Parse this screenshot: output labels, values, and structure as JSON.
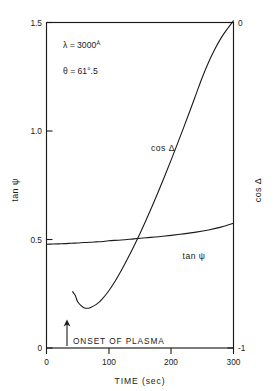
{
  "chart_data": {
    "type": "line",
    "title": "",
    "xlabel": "TIME (sec)",
    "ylabel": "tan ψ",
    "y2label": "cos Δ",
    "xlim": [
      0,
      300
    ],
    "ylim": [
      0,
      1.5
    ],
    "y2lim": [
      -1,
      0
    ],
    "xticks": [
      "0",
      "100",
      "200",
      "300"
    ],
    "xtick_values": [
      0,
      100,
      200,
      300
    ],
    "yticks": [
      "0",
      "0.5",
      "1.0",
      "1.5"
    ],
    "ytick_values": [
      0,
      0.5,
      1.0,
      1.5
    ],
    "y2ticks": [
      "-1",
      "0"
    ],
    "y2tick_values": [
      -1,
      0
    ],
    "grid": false,
    "legend_position": "inline-labels",
    "series": [
      {
        "name": "tan ψ",
        "axis": "left",
        "label_text": "tan ψ",
        "x": [
          0,
          10,
          20,
          30,
          40,
          50,
          60,
          70,
          80,
          90,
          100,
          120,
          140,
          160,
          180,
          200,
          220,
          240,
          260,
          280,
          300
        ],
        "values": [
          0.478,
          0.479,
          0.48,
          0.481,
          0.483,
          0.484,
          0.486,
          0.487,
          0.489,
          0.491,
          0.494,
          0.498,
          0.503,
          0.508,
          0.513,
          0.519,
          0.526,
          0.534,
          0.544,
          0.557,
          0.575
        ]
      },
      {
        "name": "cos Δ",
        "axis": "right",
        "label_text": "cos Δ",
        "x": [
          42,
          46,
          50,
          55,
          60,
          65,
          70,
          80,
          90,
          100,
          110,
          120,
          130,
          140,
          150,
          160,
          170,
          180,
          190,
          200,
          210,
          220,
          230,
          240,
          250,
          260,
          270,
          280,
          290,
          300
        ],
        "values": [
          -0.827,
          -0.838,
          -0.858,
          -0.869,
          -0.876,
          -0.878,
          -0.876,
          -0.866,
          -0.848,
          -0.824,
          -0.795,
          -0.762,
          -0.726,
          -0.688,
          -0.648,
          -0.606,
          -0.562,
          -0.517,
          -0.47,
          -0.422,
          -0.373,
          -0.323,
          -0.272,
          -0.22,
          -0.168,
          -0.122,
          -0.082,
          -0.048,
          -0.02,
          0.005
        ]
      }
    ],
    "annotations": [
      {
        "id": "wavelength",
        "text": "λ = 3000",
        "symbol": "Å",
        "x": 15,
        "y": 1.385
      },
      {
        "id": "angle",
        "text": "θ = 61°.5",
        "x": 15,
        "y": 1.265
      },
      {
        "id": "onset",
        "text": "ONSET OF PLASMA",
        "arrow_x": 33,
        "arrow_from_y": 0.0,
        "arrow_to_y": 0.105
      }
    ]
  }
}
